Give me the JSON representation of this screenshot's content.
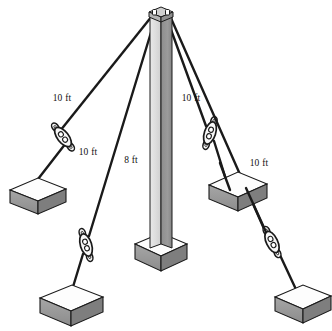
{
  "figure": {
    "background_color": "#ffffff",
    "width": 332,
    "height": 331
  },
  "labels": {
    "pole_height": "8 ft",
    "guy_back_left": "10 ft",
    "guy_front_left": "10 ft",
    "guy_back_right": "10 ft",
    "guy_front_right": "10 ft"
  },
  "colors": {
    "cable": "#1a1a1a",
    "outline": "#1a1a1a",
    "pole_light_face": "#d6d6d6",
    "pole_dark_face": "#8f8f8f",
    "pole_cap_top": "#bdbdbd",
    "block_top": "#fdfdfd",
    "block_front": "#9a9a9a",
    "block_side": "#7e7e7e",
    "hardware_fill": "#f2f2f2",
    "text": "#111111"
  },
  "pole": {
    "name": "vertical-pole",
    "height_label": "8 ft",
    "top_point": [
      160,
      12
    ],
    "base_point": [
      160,
      248
    ]
  },
  "anchors": [
    {
      "id": "anchor-back-left",
      "center": [
        36,
        196
      ],
      "top_face_width": 54,
      "top_face_height": 20,
      "depth": 13
    },
    {
      "id": "anchor-front-left",
      "center": [
        71,
        303
      ],
      "top_face_width": 62,
      "top_face_height": 23,
      "depth": 15
    },
    {
      "id": "anchor-back-right",
      "center": [
        238,
        190
      ],
      "top_face_width": 58,
      "top_face_height": 21,
      "depth": 14
    },
    {
      "id": "anchor-front-right",
      "center": [
        303,
        302
      ],
      "top_face_width": 56,
      "top_face_height": 21,
      "depth": 14
    }
  ],
  "guy_wires": [
    {
      "id": "guy-back-left",
      "label": "10 ft",
      "label_position": [
        62,
        101
      ],
      "from": [
        152,
        16
      ],
      "to": [
        28,
        192
      ],
      "turnbuckle_center": [
        63,
        137
      ]
    },
    {
      "id": "guy-front-left",
      "label": "10 ft",
      "label_position": [
        88,
        155
      ],
      "from": [
        156,
        16
      ],
      "to": [
        69,
        300
      ],
      "turnbuckle_center": [
        86,
        245
      ]
    },
    {
      "id": "guy-back-right",
      "label": "10 ft",
      "label_position": [
        174,
        101
      ],
      "from": [
        166,
        16
      ],
      "to": [
        228,
        186
      ],
      "turnbuckle_center": [
        210,
        133
      ]
    },
    {
      "id": "guy-front-right",
      "label": "10 ft",
      "label_position": [
        248,
        160
      ],
      "from": [
        170,
        16
      ],
      "to": [
        300,
        298
      ],
      "turnbuckle_center": [
        272,
        242
      ]
    }
  ]
}
